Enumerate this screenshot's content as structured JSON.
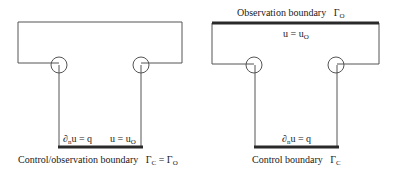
{
  "left_diagram": {
    "caption": "Control/observation boundary",
    "caption_symbol": {
      "main": "Γ",
      "sub": "C",
      "eq": " = ",
      "main2": "Γ",
      "sub2": "O"
    },
    "bottom_left_label": {
      "pre": "∂",
      "sub": "n",
      "post": "u = q"
    },
    "bottom_right_label": {
      "pre": "u = u",
      "sub": "O"
    }
  },
  "right_diagram": {
    "top_caption": "Observation boundary",
    "top_symbol": {
      "main": "Γ",
      "sub": "O"
    },
    "top_inner_label": {
      "pre": "u = u",
      "sub": "O"
    },
    "bottom_label": {
      "pre": "∂",
      "sub": "n",
      "post": "u = q"
    },
    "caption": "Control boundary",
    "caption_symbol": {
      "main": "Γ",
      "sub": "C"
    }
  },
  "colors": {
    "line": "#555555",
    "thick": "#2a2a2a"
  }
}
